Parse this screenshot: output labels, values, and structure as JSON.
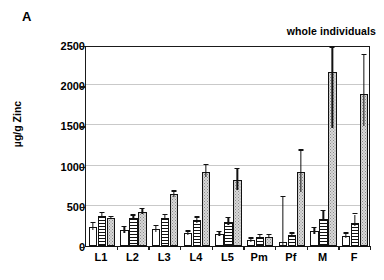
{
  "panel": {
    "label": "A",
    "annotation": "whole individuals"
  },
  "chart_data": {
    "type": "bar",
    "title": "",
    "subtitle": "",
    "annotations": [
      "A",
      "whole individuals"
    ],
    "xlabel": "",
    "ylabel": "µg/g Zinc",
    "ylim": [
      0,
      2500
    ],
    "yticks": [
      0,
      500,
      1000,
      1500,
      2000,
      2500
    ],
    "ytick_labels": [
      "0",
      "500",
      "1000",
      "1500",
      "2000",
      "2500"
    ],
    "grid": "horizontal",
    "legend": "none",
    "categories": [
      "L1",
      "L2",
      "L3",
      "L4",
      "L5",
      "Pm",
      "Pf",
      "M",
      "F"
    ],
    "series": [
      {
        "name": "open",
        "pattern": "white-open",
        "values": [
          237,
          198,
          212,
          158,
          148,
          70,
          52,
          185,
          125
        ],
        "err_low": [
          198,
          168,
          178,
          140,
          128,
          55,
          10,
          155,
          100
        ],
        "err_high": [
          285,
          232,
          248,
          178,
          172,
          90,
          605,
          222,
          152
        ]
      },
      {
        "name": "striped",
        "pattern": "horizontal-stripes",
        "values": [
          375,
          348,
          352,
          320,
          298,
          118,
          132,
          338,
          292
        ],
        "err_low": [
          345,
          322,
          322,
          292,
          258,
          100,
          112,
          305,
          255
        ],
        "err_high": [
          408,
          378,
          388,
          352,
          348,
          138,
          152,
          432,
          392
        ]
      },
      {
        "name": "dotted",
        "pattern": "fine-dots",
        "values": [
          345,
          425,
          648,
          925,
          822,
          118,
          920,
          2163,
          1890
        ],
        "err_low": [
          332,
          398,
          610,
          858,
          692,
          105,
          668,
          1468,
          1488
        ],
        "err_high": [
          358,
          462,
          678,
          1002,
          952,
          132,
          1188,
          2468,
          2378
        ]
      }
    ]
  }
}
